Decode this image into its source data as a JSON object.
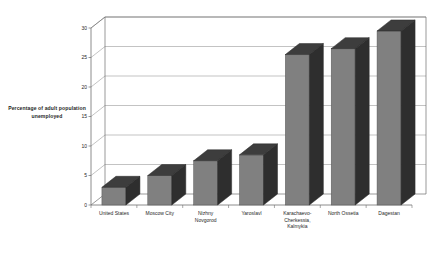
{
  "chart_data": {
    "type": "bar",
    "title": "",
    "subtitle": "",
    "xlabel": "",
    "ylabel": "Percentage of adult population unemployed",
    "categories": [
      "United States",
      "Moscow City",
      "Nizhny Novgorod",
      "Yaroslavl",
      "Karachaevo-Cherkessia, Kalmykia",
      "North Ossetia",
      "Dagestan"
    ],
    "category_lines": [
      [
        "United States"
      ],
      [
        "Moscow City"
      ],
      [
        "Nizhny",
        "Novgorod"
      ],
      [
        "Yaroslavl"
      ],
      [
        "Karachaevo-",
        "Cherkessia,",
        "Kalmykia"
      ],
      [
        "North Ossetia"
      ],
      [
        "Dagestan"
      ]
    ],
    "values": [
      3,
      5,
      7.5,
      8.5,
      25.5,
      26.5,
      29.5
    ],
    "ylim": [
      0,
      30
    ],
    "yticks": [
      0,
      5,
      10,
      15,
      20,
      25,
      30
    ],
    "ytick_labels": [
      "0",
      "5",
      "10",
      "15",
      "20",
      "25",
      "30"
    ],
    "grid": true,
    "legend": "none",
    "style": "3d-column",
    "colors": {
      "bar_front": "#808080",
      "bar_top": "#3d3d3d",
      "bar_side": "#2e2e2e",
      "grid": "#9a9a9a",
      "axis": "#6e6e6e",
      "background": "#ffffff",
      "text": "#1f1f1f"
    }
  }
}
